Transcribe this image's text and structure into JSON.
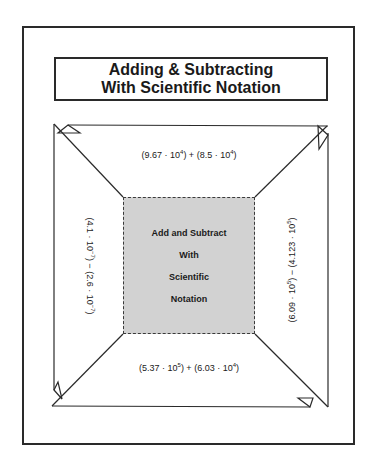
{
  "worksheet": {
    "title_line1": "Adding & Subtracting",
    "title_line2": "With Scientific Notation",
    "center": {
      "line1": "Add and Subtract",
      "line2": "With",
      "line3": "Scientific",
      "line4": "Notation"
    },
    "problems": {
      "top": {
        "a_coef": "(9.67 · 10",
        "a_exp": "4",
        "op": ") + (8.5 · 10",
        "b_exp": "4",
        "close": ")"
      },
      "left": {
        "a_coef": "(4.1 · 10",
        "a_exp": "−7",
        "op": ") − (2.6 · 10",
        "b_exp": "−7",
        "close": ")"
      },
      "right": {
        "a_coef": "(6.09 · 10",
        "a_exp": "5",
        "op": ") − (4.123 · 10",
        "b_exp": "5",
        "close": ")"
      },
      "bottom": {
        "a_coef": "(5.37 · 10",
        "a_exp": "5",
        "op": ") + (6.03 · 10",
        "b_exp": "4",
        "close": ")"
      }
    },
    "colors": {
      "line": "#2a2a2a",
      "center_fill": "#d2d2d2"
    }
  }
}
